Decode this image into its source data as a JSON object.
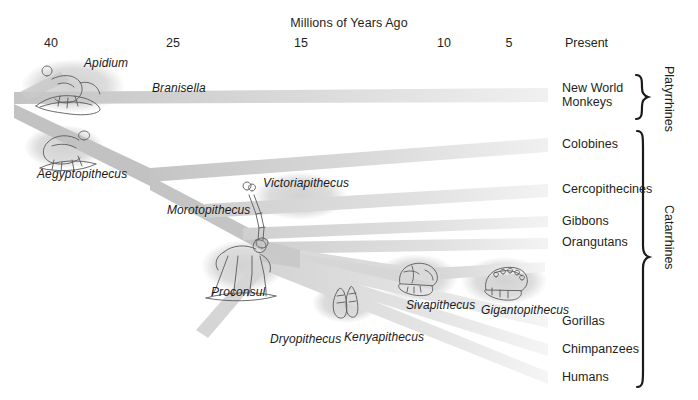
{
  "figure": {
    "axis_title": "Millions of Years Ago",
    "axis_ticks": [
      {
        "label": "40",
        "x": 51
      },
      {
        "label": "25",
        "x": 173
      },
      {
        "label": "15",
        "x": 301
      },
      {
        "label": "10",
        "x": 444
      },
      {
        "label": "5",
        "x": 509
      },
      {
        "label": "Present",
        "x": 565
      }
    ],
    "fossil_taxa": [
      {
        "name": "Apidium",
        "x": 84,
        "y": 56
      },
      {
        "name": "Branisella",
        "x": 152,
        "y": 81
      },
      {
        "name": "Aegyptopithecus",
        "x": 37,
        "y": 167
      },
      {
        "name": "Victoriapithecus",
        "x": 263,
        "y": 176
      },
      {
        "name": "Morotopithecus",
        "x": 167,
        "y": 203
      },
      {
        "name": "Proconsul",
        "x": 211,
        "y": 285
      },
      {
        "name": "Dryopithecus",
        "x": 270,
        "y": 332
      },
      {
        "name": "Kenyapithecus",
        "x": 344,
        "y": 330
      },
      {
        "name": "Sivapithecus",
        "x": 406,
        "y": 298
      },
      {
        "name": "Gigantopithecus",
        "x": 481,
        "y": 303
      }
    ],
    "living_taxa": [
      {
        "label": "New World\nMonkeys",
        "y": 82
      },
      {
        "label": "Colobines",
        "y": 138
      },
      {
        "label": "Cercopithecines",
        "y": 183
      },
      {
        "label": "Gibbons",
        "y": 215
      },
      {
        "label": "Orangutans",
        "y": 236
      },
      {
        "label": "Gorillas",
        "y": 315
      },
      {
        "label": "Chimpanzees",
        "y": 343
      },
      {
        "label": "Humans",
        "y": 371
      }
    ],
    "groups": [
      {
        "label": "Platyrrhines",
        "x": 676,
        "y": 66,
        "brace_top": 74,
        "brace_bottom": 120
      },
      {
        "label": "Catarrhines",
        "x": 676,
        "y": 205,
        "brace_top": 132,
        "brace_bottom": 387
      }
    ],
    "colors": {
      "branch_dark": "#c9c9c9",
      "branch_mid": "#d8d8d8",
      "branch_light": "#e8e8e8",
      "halo": "#dcdcdc",
      "text": "#231f20",
      "ink": "#4a4a4a"
    },
    "chart_data": {
      "type": "phylogenetic-tree",
      "title": "Primate phylogeny over the last 40 million years",
      "xlabel": "Millions of Years Ago",
      "xlim": [
        40,
        0
      ],
      "x_ticks": [
        40,
        25,
        15,
        10,
        5,
        0
      ],
      "x_tick_labels": [
        "40",
        "25",
        "15",
        "10",
        "5",
        "Present"
      ],
      "grid": false,
      "legend": "none",
      "root_age_mya": 42,
      "nodes": [
        {
          "name": "Anthropoidea root",
          "age_mya": 42,
          "children": [
            "Platyrrhini",
            "Catarrhini"
          ]
        },
        {
          "name": "Platyrrhini",
          "age_mya": 38,
          "fossils": [
            "Apidium",
            "Branisella"
          ],
          "tip": "New World Monkeys"
        },
        {
          "name": "Catarrhini",
          "age_mya": 34,
          "fossils": [
            "Aegyptopithecus"
          ],
          "children": [
            "Cercopithecoidea",
            "Hominoidea"
          ]
        },
        {
          "name": "Cercopithecoidea",
          "age_mya": 20,
          "fossils": [
            "Victoriapithecus"
          ],
          "tips": [
            "Colobines",
            "Cercopithecines"
          ]
        },
        {
          "name": "Hominoidea",
          "age_mya": 23,
          "fossils": [
            "Morotopithecus",
            "Proconsul"
          ],
          "children": [
            "Hylobatidae",
            "Hominidae"
          ]
        },
        {
          "name": "Hylobatidae",
          "age_mya": 18,
          "tip": "Gibbons"
        },
        {
          "name": "Hominidae",
          "age_mya": 16,
          "fossils": [
            "Dryopithecus",
            "Kenyapithecus",
            "Sivapithecus",
            "Gigantopithecus"
          ],
          "tips": [
            "Orangutans",
            "Gorillas",
            "Chimpanzees",
            "Humans"
          ]
        }
      ],
      "tips": [
        {
          "label": "New World Monkeys",
          "group": "Platyrrhines",
          "y": 96
        },
        {
          "label": "Colobines",
          "group": "Catarrhines",
          "y": 145
        },
        {
          "label": "Cercopithecines",
          "group": "Catarrhines",
          "y": 190
        },
        {
          "label": "Gibbons",
          "group": "Catarrhines",
          "y": 222
        },
        {
          "label": "Orangutans",
          "group": "Catarrhines",
          "y": 243
        },
        {
          "label": "Gorillas",
          "group": "Catarrhines",
          "y": 322
        },
        {
          "label": "Chimpanzees",
          "group": "Catarrhines",
          "y": 350
        },
        {
          "label": "Humans",
          "group": "Catarrhines",
          "y": 378
        }
      ],
      "fossils": [
        "Apidium",
        "Branisella",
        "Aegyptopithecus",
        "Victoriapithecus",
        "Morotopithecus",
        "Proconsul",
        "Dryopithecus",
        "Kenyapithecus",
        "Sivapithecus",
        "Gigantopithecus"
      ],
      "illustrations": [
        {
          "name": "Apidium",
          "kind": "skeleton-on-branch",
          "x": 70,
          "y": 88
        },
        {
          "name": "Aegyptopithecus",
          "kind": "skeleton-quadruped",
          "x": 62,
          "y": 147
        },
        {
          "name": "Morotopithecus",
          "kind": "vertebra-bone",
          "x": 253,
          "y": 215
        },
        {
          "name": "Proconsul",
          "kind": "skeleton-quadruped",
          "x": 240,
          "y": 265
        },
        {
          "name": "Kenyapithecus",
          "kind": "jaw-fragment",
          "x": 347,
          "y": 300
        },
        {
          "name": "Sivapithecus",
          "kind": "cranium",
          "x": 414,
          "y": 277
        },
        {
          "name": "Gigantopithecus",
          "kind": "mandible",
          "x": 502,
          "y": 280
        }
      ]
    }
  }
}
